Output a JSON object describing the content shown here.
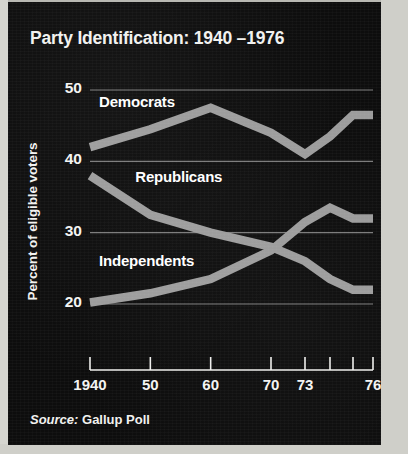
{
  "figure": {
    "title": "Party Identification: 1940 –1976",
    "source_key": "Source:",
    "source_value": "Gallup Poll",
    "background_color": "#0d0d0d",
    "text_color": "#f2f2f0",
    "line_color": "#9c9c9c",
    "grid_color": "#8f8f8f"
  },
  "chart_data": {
    "type": "line",
    "title": "Party Identification: 1940 –1976",
    "xlabel": "",
    "ylabel": "Percent of eligible voters",
    "ylim": [
      15,
      52
    ],
    "yticks": [
      50,
      40,
      30,
      20
    ],
    "ytick_labels": [
      "50",
      "40",
      "30",
      "20"
    ],
    "xlim": [
      1940,
      1976
    ],
    "xticks": [
      1940,
      1950,
      1960,
      1970,
      1973,
      1974,
      1975,
      1976
    ],
    "xtick_labels": [
      "1940",
      "50",
      "60",
      "70",
      "73",
      "",
      "",
      "76"
    ],
    "labeled_xticks": [
      {
        "year": 1940,
        "label": "1940"
      },
      {
        "year": 1950,
        "label": "50"
      },
      {
        "year": 1960,
        "label": "60"
      },
      {
        "year": 1970,
        "label": "70"
      },
      {
        "year": 1973,
        "label": "73"
      },
      {
        "year": 1976,
        "label": "76"
      }
    ],
    "grid": "horizontal",
    "legend": "inline-labels",
    "x": [
      1940,
      1950,
      1960,
      1970,
      1973,
      1974,
      1975,
      1976
    ],
    "series": [
      {
        "name": "Democrats",
        "label": "Democrats",
        "color": "#9c9c9c",
        "values": [
          42,
          44.5,
          47.5,
          44,
          41,
          43.5,
          46.5,
          46.5
        ]
      },
      {
        "name": "Republicans",
        "label": "Republicans",
        "color": "#9c9c9c",
        "values": [
          38,
          32.5,
          30,
          28,
          26,
          23.5,
          22,
          22
        ]
      },
      {
        "name": "Independents",
        "label": "Independents",
        "color": "#9c9c9c",
        "values": [
          20.2,
          21.5,
          23.5,
          27.5,
          31.5,
          33.5,
          32,
          32
        ]
      }
    ],
    "annotations": [
      {
        "text": "Democrats",
        "x": 1941.5,
        "y": 48.3
      },
      {
        "text": "Republicans",
        "x": 1947.5,
        "y": 37.8
      },
      {
        "text": "Independents",
        "x": 1941.5,
        "y": 26.0
      }
    ]
  }
}
